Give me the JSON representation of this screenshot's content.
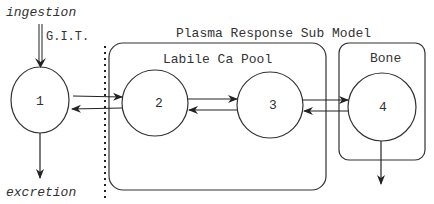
{
  "diagram": {
    "labels": {
      "ingestion": "ingestion",
      "git": "G.I.T.",
      "excretion": "excretion",
      "plasma_submodel": "Plasma Response Sub Model",
      "labile_pool": "Labile Ca Pool",
      "bone": "Bone"
    },
    "nodes": [
      {
        "id": "1",
        "label": "1"
      },
      {
        "id": "2",
        "label": "2"
      },
      {
        "id": "3",
        "label": "3"
      },
      {
        "id": "4",
        "label": "4"
      }
    ],
    "edges": [
      {
        "from": "ingestion",
        "to": "1",
        "style": "double"
      },
      {
        "from": "1",
        "to": "2"
      },
      {
        "from": "2",
        "to": "1"
      },
      {
        "from": "2",
        "to": "3"
      },
      {
        "from": "3",
        "to": "2"
      },
      {
        "from": "3",
        "to": "4"
      },
      {
        "from": "4",
        "to": "3"
      },
      {
        "from": "1",
        "to": "excretion"
      },
      {
        "from": "4",
        "to": "out"
      }
    ],
    "colors": {
      "stroke": "#333333",
      "text": "#333333"
    }
  }
}
